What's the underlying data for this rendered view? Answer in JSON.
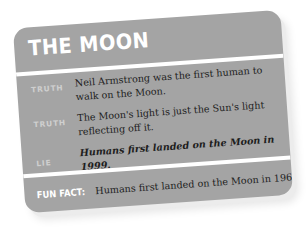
{
  "card": {
    "title": "THE MOON",
    "background_color": "#a4a4a4",
    "divider_color": "#ffffff",
    "statements": [
      {
        "label": "TRUTH",
        "text": "Neil Armstrong was the first human to walk on the Moon.",
        "type": "truth"
      },
      {
        "label": "TRUTH",
        "text": "The Moon's light is just the Sun's light reflecting  off it.",
        "type": "truth"
      },
      {
        "label": "LIE",
        "text": "Humans first landed on the Moon in 1999.",
        "type": "lie"
      }
    ],
    "fun_fact": {
      "label": "FUN FACT:",
      "text": "Humans first landed on the Moon in 1969."
    }
  }
}
